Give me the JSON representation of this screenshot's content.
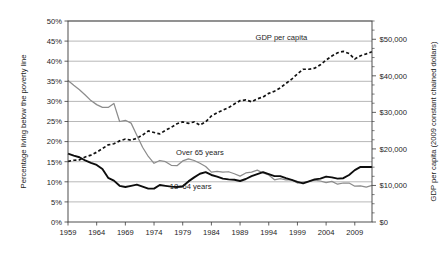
{
  "chart_data": {
    "type": "line",
    "title": "",
    "xlabel": "",
    "ylabel": "Percentage living below the poverty line",
    "y2label": "GDP per capita (2009 constant chained dollars)",
    "xlim": [
      1959,
      2012
    ],
    "ylim": [
      0,
      50
    ],
    "y2lim": [
      0,
      55000
    ],
    "grid": true,
    "legend_position": "inline-annotations",
    "xticks": [
      "1959",
      "1964",
      "1969",
      "1974",
      "1979",
      "1984",
      "1989",
      "1994",
      "1999",
      "2004",
      "2009"
    ],
    "xtick_values": [
      1959,
      1964,
      1969,
      1974,
      1979,
      1984,
      1989,
      1994,
      1999,
      2004,
      2009
    ],
    "yticks": [
      "0%",
      "5%",
      "10%",
      "15%",
      "20%",
      "25%",
      "30%",
      "35%",
      "40%",
      "45%",
      "50%"
    ],
    "ytick_values": [
      0,
      5,
      10,
      15,
      20,
      25,
      30,
      35,
      40,
      45,
      50
    ],
    "y2ticks": [
      "$0",
      "$10,000",
      "$20,000",
      "$30,000",
      "$40,000",
      "$50,000"
    ],
    "y2tick_values": [
      0,
      10000,
      20000,
      30000,
      40000,
      50000
    ],
    "y2_minor_step": 2500,
    "annotations": [
      {
        "text": "GDP per capita",
        "x": 1996.2,
        "y_pct": 45.2
      },
      {
        "text": "Over 65 years",
        "x": 1982.0,
        "y_pct": 16.6
      },
      {
        "text": "18–64 years",
        "x": 1980.4,
        "y_pct": 8.2
      }
    ],
    "series": [
      {
        "name": "GDP per capita",
        "axis": "right",
        "style": "dashed",
        "color": "#111111",
        "x": [
          1959,
          1960,
          1961,
          1962,
          1963,
          1964,
          1965,
          1966,
          1967,
          1968,
          1969,
          1970,
          1971,
          1972,
          1973,
          1974,
          1975,
          1976,
          1977,
          1978,
          1979,
          1980,
          1981,
          1982,
          1983,
          1984,
          1985,
          1986,
          1987,
          1988,
          1989,
          1990,
          1991,
          1992,
          1993,
          1994,
          1995,
          1996,
          1997,
          1998,
          1999,
          2000,
          2001,
          2002,
          2003,
          2004,
          2005,
          2006,
          2007,
          2008,
          2009,
          2010,
          2011,
          2012
        ],
        "values": [
          16600,
          16900,
          17000,
          17800,
          18300,
          19100,
          20100,
          21100,
          21400,
          22200,
          22700,
          22400,
          22900,
          23800,
          24900,
          24500,
          24100,
          25100,
          25900,
          26900,
          27400,
          27000,
          27400,
          26500,
          27400,
          29000,
          29900,
          30600,
          31300,
          32300,
          33200,
          33400,
          32900,
          33700,
          34200,
          35200,
          35800,
          36700,
          37900,
          39100,
          40500,
          41800,
          41800,
          42100,
          43000,
          44300,
          45400,
          46300,
          46700,
          46100,
          44600,
          45500,
          46000,
          46600
        ]
      },
      {
        "name": "Over 65 years",
        "axis": "left",
        "style": "solid-thin",
        "color": "#8c8c8c",
        "x": [
          1959,
          1960,
          1961,
          1962,
          1963,
          1964,
          1965,
          1966,
          1967,
          1968,
          1969,
          1970,
          1971,
          1972,
          1973,
          1974,
          1975,
          1976,
          1977,
          1978,
          1979,
          1980,
          1981,
          1982,
          1983,
          1984,
          1985,
          1986,
          1987,
          1988,
          1989,
          1990,
          1991,
          1992,
          1993,
          1994,
          1995,
          1996,
          1997,
          1998,
          1999,
          2000,
          2001,
          2002,
          2003,
          2004,
          2005,
          2006,
          2007,
          2008,
          2009,
          2010,
          2011,
          2012
        ],
        "values": [
          35.2,
          34.0,
          32.9,
          31.6,
          30.2,
          29.2,
          28.5,
          28.5,
          29.5,
          25.0,
          25.3,
          24.6,
          21.6,
          18.6,
          16.3,
          14.6,
          15.3,
          15.0,
          14.1,
          14.0,
          15.2,
          15.7,
          15.3,
          14.6,
          13.8,
          12.4,
          12.6,
          12.4,
          12.5,
          12.0,
          11.4,
          12.2,
          12.4,
          12.9,
          12.2,
          11.7,
          10.5,
          10.8,
          10.5,
          10.5,
          9.7,
          9.9,
          10.1,
          10.4,
          10.2,
          9.8,
          10.1,
          9.4,
          9.7,
          9.7,
          8.9,
          9.0,
          8.7,
          9.1
        ]
      },
      {
        "name": "18–64 years",
        "axis": "left",
        "style": "solid-thick",
        "color": "#0d0d0d",
        "x": [
          1959,
          1960,
          1961,
          1962,
          1963,
          1964,
          1965,
          1966,
          1967,
          1968,
          1969,
          1970,
          1971,
          1972,
          1973,
          1974,
          1975,
          1976,
          1977,
          1978,
          1979,
          1980,
          1981,
          1982,
          1983,
          1984,
          1985,
          1986,
          1987,
          1988,
          1989,
          1990,
          1991,
          1992,
          1993,
          1994,
          1995,
          1996,
          1997,
          1998,
          1999,
          2000,
          2001,
          2002,
          2003,
          2004,
          2005,
          2006,
          2007,
          2008,
          2009,
          2010,
          2011,
          2012
        ],
        "values": [
          17.0,
          16.5,
          16.1,
          15.3,
          14.7,
          14.2,
          13.2,
          11.0,
          10.3,
          9.0,
          8.7,
          9.0,
          9.3,
          8.8,
          8.3,
          8.3,
          9.2,
          9.0,
          8.8,
          8.7,
          8.9,
          10.1,
          11.1,
          12.0,
          12.4,
          11.7,
          11.3,
          10.8,
          10.6,
          10.5,
          10.2,
          10.7,
          11.4,
          11.9,
          12.4,
          11.9,
          11.4,
          11.4,
          10.9,
          10.5,
          10.0,
          9.6,
          10.1,
          10.6,
          10.8,
          11.3,
          11.1,
          10.8,
          10.9,
          11.7,
          12.9,
          13.7,
          13.7,
          13.7
        ]
      }
    ]
  },
  "geometry": {
    "plot_left": 68,
    "plot_right": 372,
    "plot_top": 21,
    "plot_bottom": 222
  }
}
